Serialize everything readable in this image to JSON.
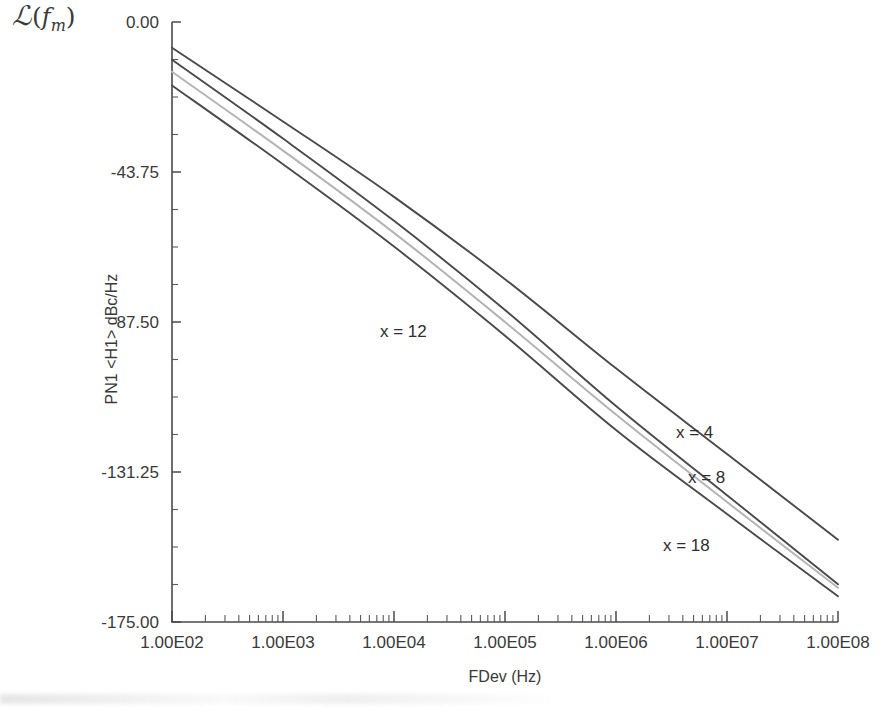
{
  "figure": {
    "corner_label": {
      "script_l": "ℒ",
      "open_paren": "(",
      "f": "f",
      "subscript": "m",
      "close_paren": ")"
    }
  },
  "chart_data": {
    "type": "line",
    "title": "",
    "xlabel": "FDev (Hz)",
    "ylabel": "PN1 <H1> dBc/Hz",
    "xscale": "log",
    "xlim": [
      100,
      100000000
    ],
    "ylim": [
      -175.0,
      0.0
    ],
    "grid": false,
    "legend": "inline-annotations",
    "xticks": [
      100,
      1000,
      10000,
      100000,
      1000000,
      10000000,
      100000000
    ],
    "xtick_labels": [
      "1.00E02",
      "1.00E03",
      "1.00E04",
      "1.00E05",
      "1.00E06",
      "1.00E07",
      "1.00E08"
    ],
    "yticks": [
      0.0,
      -43.75,
      -87.5,
      -131.25,
      -175.0
    ],
    "ytick_labels": [
      "0.00",
      "-43.75",
      "-87.50",
      "-131.25",
      "-175.00"
    ],
    "y_minor_ticks_per_interval": 4,
    "x": [
      100,
      1000,
      10000,
      100000,
      1000000,
      10000000,
      100000000
    ],
    "series": [
      {
        "name": "x = 4",
        "label": "x = 4",
        "color": "#4a4a4a",
        "label_x_px": 676,
        "label_y_px": 438,
        "values": [
          -7.5,
          -29.0,
          -51.0,
          -75.0,
          -101.0,
          -126.0,
          -151.0
        ]
      },
      {
        "name": "x = 8",
        "label": "x = 8",
        "color": "#4a4a4a",
        "label_x_px": 688,
        "label_y_px": 483,
        "values": [
          -11.0,
          -34.0,
          -58.0,
          -84.0,
          -112.0,
          -138.0,
          -164.0
        ]
      },
      {
        "name": "x = 12",
        "label": "x = 12",
        "color": "#b4b4b4",
        "label_x_px": 380,
        "label_y_px": 337,
        "values": [
          -14.5,
          -37.5,
          -61.5,
          -87.5,
          -114.5,
          -140.0,
          -165.0
        ]
      },
      {
        "name": "x = 18",
        "label": "x = 18",
        "color": "#4a4a4a",
        "label_x_px": 663,
        "label_y_px": 551,
        "values": [
          -18.5,
          -41.5,
          -65.5,
          -91.5,
          -119.0,
          -143.5,
          -167.5
        ]
      }
    ]
  }
}
